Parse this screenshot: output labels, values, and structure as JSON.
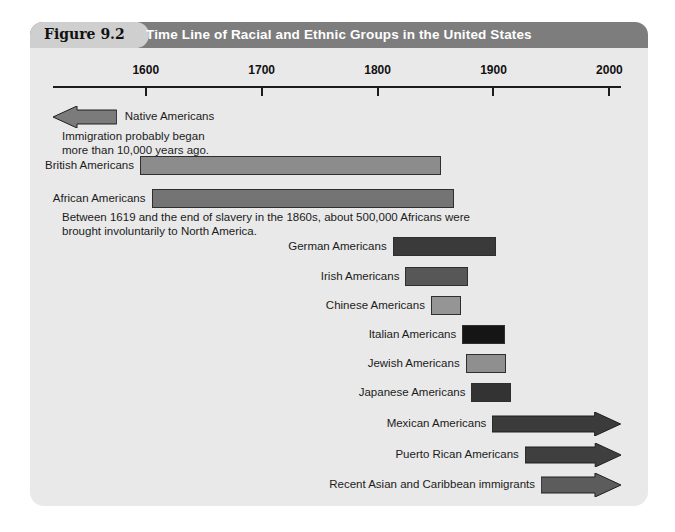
{
  "figure": {
    "number_label": "Figure 9.2",
    "title": "Time Line of Racial and Ethnic Groups in the United States",
    "title_bar_color": "#7d7d7d",
    "tab_color": "#cfcfcf",
    "panel_color": "#e9e9e9"
  },
  "axis": {
    "ticks": [
      "1600",
      "1700",
      "1800",
      "1900",
      "2000"
    ],
    "start_year": 1520,
    "end_year": 2010,
    "line_color": "#1c1c1c"
  },
  "chart_data": {
    "type": "bar",
    "title": "Time Line of Racial and Ethnic Groups in the United States",
    "xlabel": "",
    "ylabel": "",
    "xlim": [
      1520,
      2010
    ],
    "grid": false,
    "legend": "none",
    "categories": [
      "Native Americans",
      "British Americans",
      "African Americans",
      "German Americans",
      "Irish Americans",
      "Chinese Americans",
      "Italian Americans",
      "Jewish Americans",
      "Japanese Americans",
      "Mexican Americans",
      "Puerto Rican Americans",
      "Recent Asian and Caribbean immigrants"
    ],
    "bars": [
      {
        "label": "Native Americans",
        "start_year": 1520,
        "end_year": 1575,
        "style": "arrow-left",
        "color": "#7b7b7b",
        "note": "Immigration probably began\nmore than 10,000 years ago."
      },
      {
        "label": "British Americans",
        "start_year": 1595,
        "end_year": 1855,
        "style": "bar",
        "color": "#8c8c8c",
        "note": ""
      },
      {
        "label": "African Americans",
        "start_year": 1605,
        "end_year": 1866,
        "style": "bar",
        "color": "#747474",
        "note": "Between 1619 and the end of slavery in the 1860s, about 500,000 Africans were\nbrought involuntarily to North America."
      },
      {
        "label": "German Americans",
        "start_year": 1813,
        "end_year": 1902,
        "style": "bar",
        "color": "#3a3a3a",
        "note": ""
      },
      {
        "label": "Irish Americans",
        "start_year": 1824,
        "end_year": 1878,
        "style": "bar",
        "color": "#575757",
        "note": ""
      },
      {
        "label": "Chinese Americans",
        "start_year": 1846,
        "end_year": 1872,
        "style": "bar",
        "color": "#959595",
        "note": ""
      },
      {
        "label": "Italian Americans",
        "start_year": 1873,
        "end_year": 1910,
        "style": "bar",
        "color": "#151515",
        "note": ""
      },
      {
        "label": "Jewish Americans",
        "start_year": 1876,
        "end_year": 1911,
        "style": "bar",
        "color": "#8f8f8f",
        "note": ""
      },
      {
        "label": "Japanese Americans",
        "start_year": 1881,
        "end_year": 1915,
        "style": "bar",
        "color": "#333333",
        "note": ""
      },
      {
        "label": "Mexican Americans",
        "start_year": 1899,
        "end_year": 2010,
        "style": "arrow-right",
        "color": "#3b3b3b",
        "note": ""
      },
      {
        "label": "Puerto Rican Americans",
        "start_year": 1927,
        "end_year": 2010,
        "style": "arrow-right",
        "color": "#3f3f3f",
        "note": ""
      },
      {
        "label": "Recent Asian and Caribbean immigrants",
        "start_year": 1941,
        "end_year": 2010,
        "style": "arrow-right",
        "color": "#5c5c5c",
        "note": ""
      }
    ]
  }
}
